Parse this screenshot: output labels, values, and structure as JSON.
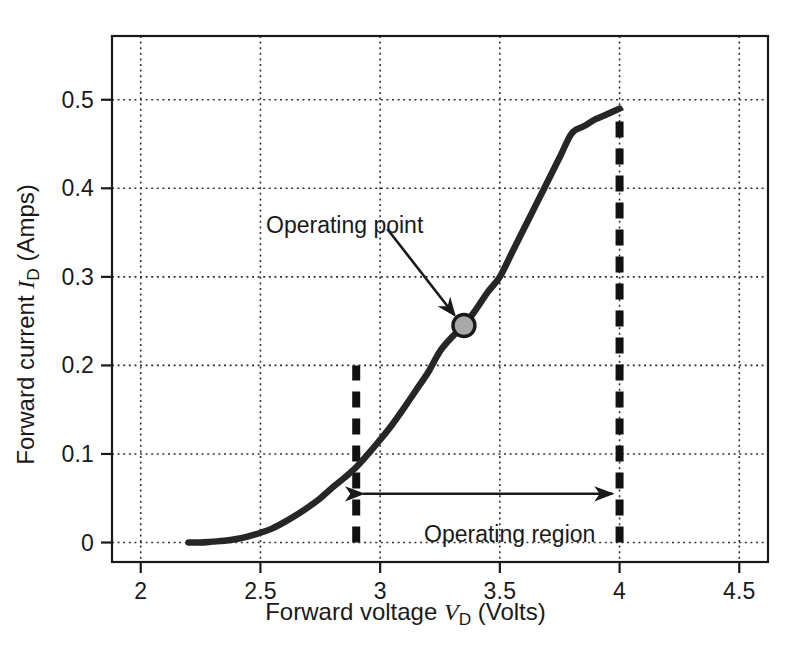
{
  "chart_data": {
    "type": "line",
    "title": "",
    "xlabel": "Forward voltage V_D (Volts)",
    "ylabel": "Forward current I_D (Amps)",
    "xlabel_parts": {
      "prefix": "Forward voltage ",
      "symbol": "V",
      "subscript": "D",
      "suffix": " (Volts)"
    },
    "ylabel_parts": {
      "prefix": "Forward current ",
      "symbol": "I",
      "subscript": "D",
      "suffix": " (Amps)"
    },
    "xlim": [
      1.88,
      4.62
    ],
    "ylim": [
      -0.022,
      0.572
    ],
    "xticks": [
      2,
      2.5,
      3,
      3.5,
      4,
      4.5
    ],
    "xtick_labels": [
      "2",
      "2.5",
      "3",
      "3.5",
      "4",
      "4.5"
    ],
    "yticks": [
      0,
      0.1,
      0.2,
      0.3,
      0.4,
      0.5
    ],
    "ytick_labels": [
      "0",
      "0.1",
      "0.2",
      "0.3",
      "0.4",
      "0.5"
    ],
    "grid": true,
    "grid_style": "dotted",
    "legend": "none",
    "series": [
      {
        "name": "Diode I-V characteristic",
        "color": "#262626",
        "x": [
          2.2,
          2.25,
          2.3,
          2.35,
          2.4,
          2.45,
          2.5,
          2.55,
          2.6,
          2.65,
          2.7,
          2.75,
          2.8,
          2.85,
          2.9,
          2.95,
          3.0,
          3.05,
          3.1,
          3.15,
          3.2,
          3.25,
          3.3,
          3.35,
          3.4,
          3.45,
          3.5,
          3.55,
          3.6,
          3.65,
          3.7,
          3.75,
          3.8,
          3.85,
          3.9,
          3.95,
          4.0
        ],
        "y": [
          0.0,
          0.0,
          0.001,
          0.002,
          0.004,
          0.007,
          0.011,
          0.016,
          0.023,
          0.031,
          0.04,
          0.05,
          0.062,
          0.073,
          0.085,
          0.1,
          0.116,
          0.133,
          0.152,
          0.172,
          0.192,
          0.216,
          0.232,
          0.245,
          0.263,
          0.283,
          0.3,
          0.327,
          0.354,
          0.381,
          0.408,
          0.435,
          0.462,
          0.47,
          0.478,
          0.484,
          0.49
        ]
      }
    ],
    "annotations": [
      {
        "name": "operating-point",
        "text": "Operating point",
        "text_x": 3.01,
        "text_y": 0.372,
        "marker": {
          "x": 3.35,
          "y": 0.245,
          "shape": "circle",
          "fill": "#a8a8a8",
          "stroke": "#1a1a1a",
          "radius": 11
        },
        "arrow": {
          "from_x": 3.03,
          "from_y": 0.354,
          "to_x": 3.31,
          "to_y": 0.257
        }
      },
      {
        "name": "operating-region",
        "text": "Operating region",
        "text_x": 3.55,
        "text_y": 0.03,
        "arrow": {
          "from_x": 2.9,
          "from_y": 0.055,
          "to_x": 4.0,
          "to_y": 0.055,
          "double_headed": true
        }
      }
    ],
    "markers": [
      {
        "name": "operating-point-marker",
        "x": 3.35,
        "y": 0.245,
        "label": "Operating point"
      }
    ],
    "region_bounds": {
      "name": "operating-region",
      "left_v": 2.9,
      "right_v": 4.0,
      "left_line_top_i": 0.2,
      "right_line_top_i": 0.49,
      "style": "dashed",
      "color": "#111111"
    }
  },
  "colors": {
    "background": "#ffffff",
    "curve": "#262626",
    "grid": "#333333",
    "frame": "#1a1a1a",
    "marker_fill": "#a8a8a8",
    "marker_stroke": "#1a1a1a",
    "dashed_guides": "#111111",
    "text": "#1a1a1a"
  }
}
